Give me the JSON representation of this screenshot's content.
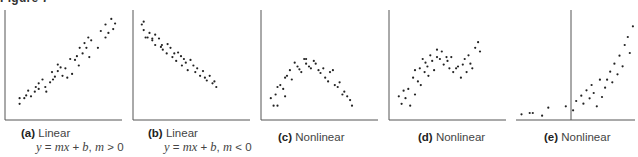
{
  "figure": {
    "title": "Figure 7",
    "panels": [
      {
        "tag": "(a)",
        "label": "Linear",
        "equation": "y = mx + b, m > 0"
      },
      {
        "tag": "(b)",
        "label": "Linear",
        "equation": "y = mx + b, m < 0"
      },
      {
        "tag": "(c)",
        "label": "Nonlinear",
        "equation": ""
      },
      {
        "tag": "(d)",
        "label": "Nonlinear",
        "equation": ""
      },
      {
        "tag": "(e)",
        "label": "Nonlinear",
        "equation": ""
      }
    ]
  },
  "chart_data": [
    {
      "type": "scatter",
      "title": "(a) Linear",
      "subtitle": "y = mx + b, m > 0",
      "xlabel": "",
      "ylabel": "",
      "grid": false,
      "axis_style": "left-bottom",
      "x": [
        10,
        10,
        15,
        17,
        19,
        22,
        26,
        27,
        30,
        30,
        34,
        37,
        38,
        42,
        44,
        45,
        47,
        50,
        50,
        53,
        55,
        58,
        60,
        63,
        65,
        68,
        70,
        72,
        73,
        76,
        78,
        80,
        82,
        83,
        85,
        92,
        95,
        100,
        100,
        103,
        106,
        108,
        110
      ],
      "y": [
        12,
        18,
        18,
        21,
        26,
        20,
        25,
        30,
        28,
        34,
        38,
        30,
        25,
        35,
        46,
        38,
        41,
        47,
        54,
        51,
        42,
        50,
        40,
        60,
        44,
        59,
        63,
        53,
        72,
        66,
        77,
        72,
        83,
        62,
        80,
        72,
        90,
        83,
        97,
        88,
        103,
        92,
        98
      ]
    },
    {
      "type": "scatter",
      "title": "(b) Linear",
      "subtitle": "y = mx + b, m < 0",
      "xlabel": "",
      "ylabel": "",
      "grid": false,
      "axis_style": "left-bottom",
      "x": [
        4,
        6,
        6,
        8,
        10,
        12,
        15,
        15,
        18,
        18,
        22,
        24,
        25,
        26,
        30,
        31,
        34,
        36,
        38,
        40,
        42,
        45,
        46,
        48,
        50,
        52,
        55,
        58,
        60,
        62,
        65,
        68,
        70,
        72,
        75,
        78,
        80,
        82
      ],
      "y": [
        97,
        100,
        91,
        83,
        83,
        88,
        82,
        80,
        86,
        75,
        82,
        73,
        75,
        70,
        66,
        76,
        72,
        62,
        66,
        58,
        67,
        63,
        53,
        60,
        56,
        48,
        59,
        53,
        46,
        50,
        42,
        47,
        40,
        37,
        42,
        34,
        36,
        30
      ]
    },
    {
      "type": "scatter",
      "title": "(c) Nonlinear",
      "xlabel": "",
      "ylabel": "",
      "grid": false,
      "axis_style": "left-bottom",
      "x": [
        5,
        8,
        10,
        12,
        12,
        15,
        18,
        20,
        20,
        22,
        25,
        27,
        30,
        33,
        35,
        37,
        40,
        42,
        42,
        45,
        47,
        50,
        52,
        55,
        57,
        60,
        62,
        65,
        67,
        70,
        72,
        75,
        77,
        80,
        82,
        85,
        88,
        90
      ],
      "y": [
        18,
        10,
        22,
        10,
        30,
        32,
        28,
        40,
        20,
        42,
        48,
        38,
        56,
        52,
        49,
        46,
        60,
        60,
        55,
        52,
        50,
        58,
        55,
        48,
        45,
        50,
        40,
        36,
        46,
        48,
        32,
        30,
        35,
        22,
        25,
        20,
        16,
        10
      ]
    },
    {
      "type": "scatter",
      "title": "(d) Nonlinear",
      "xlabel": "",
      "ylabel": "",
      "grid": false,
      "axis_style": "left-bottom",
      "x": [
        5,
        8,
        10,
        12,
        15,
        17,
        20,
        22,
        22,
        25,
        27,
        28,
        30,
        32,
        33,
        35,
        36,
        38,
        40,
        42,
        45,
        45,
        48,
        50,
        52,
        55,
        56,
        58,
        60,
        62,
        65,
        67,
        70,
        72,
        74,
        76,
        78,
        80,
        82,
        85,
        88,
        90
      ],
      "y": [
        20,
        12,
        26,
        18,
        28,
        10,
        40,
        22,
        48,
        36,
        50,
        32,
        60,
        46,
        56,
        52,
        42,
        64,
        58,
        48,
        62,
        70,
        60,
        68,
        54,
        62,
        58,
        50,
        62,
        46,
        50,
        52,
        40,
        54,
        60,
        46,
        64,
        55,
        50,
        72,
        78,
        68
      ]
    },
    {
      "type": "scatter",
      "title": "(e) Nonlinear",
      "xlabel": "",
      "ylabel": "",
      "grid": false,
      "axis_style": "centered-y-axis",
      "x": [
        -0.48,
        -0.4,
        -0.37,
        -0.28,
        -0.22,
        -0.05,
        0.02,
        0.05,
        0.1,
        0.12,
        0.15,
        0.18,
        0.2,
        0.22,
        0.25,
        0.28,
        0.3,
        0.33,
        0.35,
        0.38,
        0.4,
        0.42,
        0.45,
        0.47,
        0.5,
        0.52,
        0.55,
        0.57,
        0.6
      ],
      "y": [
        2,
        3,
        3,
        1,
        7,
        8,
        5,
        12,
        16,
        10,
        20,
        14,
        24,
        18,
        8,
        28,
        15,
        22,
        28,
        34,
        26,
        40,
        32,
        46,
        38,
        54,
        60,
        48,
        68
      ]
    }
  ]
}
